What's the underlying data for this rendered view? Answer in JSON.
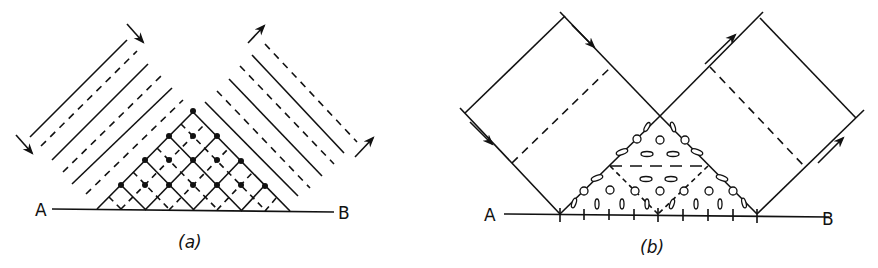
{
  "figure": {
    "panels": [
      {
        "id": "a",
        "caption": "(a)",
        "endpoint_left": "A",
        "endpoint_right": "B",
        "description": "Incident wavefronts (solid and dashed parallel lines) approaching surface AB from upper left, reflected wavefronts leaving to upper right; interference region shown as crosshatched triangle with dots at intersections of solid lines."
      },
      {
        "id": "b",
        "caption": "(b)",
        "endpoint_left": "A",
        "endpoint_right": "B",
        "description": "Incident ray bundle bounded by arrowed rays striking surface AB and reflected bundle; triangular overlap region filled with ellipse/circle symbols indicating polarization states, with tick marks along AB."
      }
    ]
  }
}
